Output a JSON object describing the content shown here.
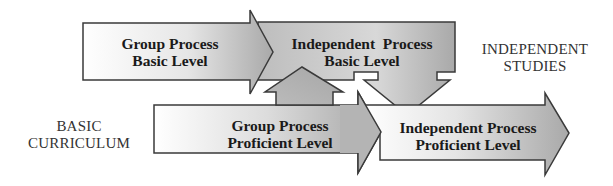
{
  "diagram": {
    "type": "progression-arrows",
    "nodes": [
      {
        "id": "gp-basic",
        "line1": "Group Process",
        "line2": "Basic Level"
      },
      {
        "id": "ip-basic",
        "line1": "Independent  Process",
        "line2": "Basic Level"
      },
      {
        "id": "gp-proficient",
        "line1": "Group Process",
        "line2": "Proficient Level"
      },
      {
        "id": "ip-proficient",
        "line1": "Independent Process",
        "line2": "Proficient Level"
      }
    ],
    "side_labels": {
      "basic_curriculum": {
        "line1": "BASIC",
        "line2": "CURRICULUM"
      },
      "independent_studies": {
        "line1": "INDEPENDENT",
        "line2": "STUDIES"
      }
    },
    "edges": [
      {
        "from": "gp-basic",
        "to": "ip-basic",
        "direction": "right"
      },
      {
        "from": "gp-proficient",
        "to": "ip-basic",
        "direction": "up"
      },
      {
        "from": "ip-basic",
        "to": "ip-proficient",
        "direction": "down"
      },
      {
        "from": "gp-proficient",
        "to": "ip-proficient",
        "direction": "right"
      }
    ],
    "colors": {
      "stroke": "#3a3a3a",
      "fill_light": "#ffffff",
      "fill_dark": "#a8a8a8",
      "text": "#1a1a1a"
    }
  }
}
